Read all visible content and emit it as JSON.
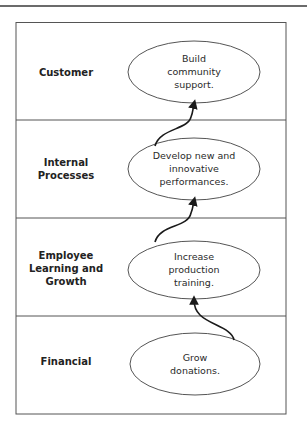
{
  "diagram": {
    "type": "strategy-map",
    "colors": {
      "line": "#555555",
      "topbar": "#6b6b6b",
      "arrow": "#1a1a1a",
      "text": "#222222"
    },
    "rows": [
      {
        "perspective": "Customer",
        "objective": "Build\ncommunity\nsupport."
      },
      {
        "perspective": "Internal\nProcesses",
        "objective": "Develop new and\ninnovative\nperformances."
      },
      {
        "perspective": "Employee\nLearning and\nGrowth",
        "objective": "Increase\nproduction\ntraining."
      },
      {
        "perspective": "Financial",
        "objective": "Grow\ndonations."
      }
    ],
    "links": [
      {
        "from": "Grow donations.",
        "to": "Increase production training."
      },
      {
        "from": "Increase production training.",
        "to": "Develop new and innovative performances."
      },
      {
        "from": "Develop new and innovative performances.",
        "to": "Build community support."
      }
    ]
  }
}
